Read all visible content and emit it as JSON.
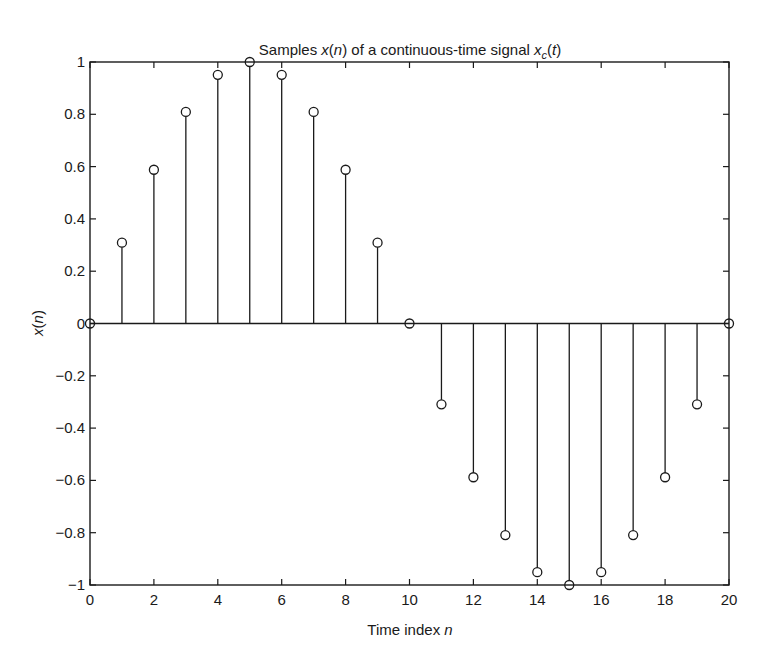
{
  "chart_data": {
    "type": "stem",
    "title_parts": {
      "prefix": "Samples ",
      "x": "x",
      "n": "n",
      "middle": " of a continuous-time signal ",
      "xc": "x",
      "sub": "c",
      "t": "t"
    },
    "xlabel": "Time index n",
    "xlabel_parts": {
      "text": "Time index ",
      "var": "n"
    },
    "ylabel": "x(n)",
    "ylabel_parts": {
      "x": "x",
      "n": "n"
    },
    "xlim": [
      0,
      20
    ],
    "ylim": [
      -1,
      1
    ],
    "grid": false,
    "legend": null,
    "marker": "open-circle",
    "color": "#1a1a1a",
    "xticks": [
      0,
      2,
      4,
      6,
      8,
      10,
      12,
      14,
      16,
      18,
      20
    ],
    "xtick_labels": [
      "0",
      "2",
      "4",
      "6",
      "8",
      "10",
      "12",
      "14",
      "16",
      "18",
      "20"
    ],
    "yticks": [
      1,
      0.8,
      0.6,
      0.4,
      0.2,
      0,
      -0.2,
      -0.4,
      -0.6,
      -0.8,
      -1
    ],
    "ytick_labels": [
      "1",
      "0.8",
      "0.6",
      "0.4",
      "0.2",
      "0",
      "−0.2",
      "−0.4",
      "−0.6",
      "−0.8",
      "−1"
    ],
    "x": [
      0,
      1,
      2,
      3,
      4,
      5,
      6,
      7,
      8,
      9,
      10,
      11,
      12,
      13,
      14,
      15,
      16,
      17,
      18,
      19,
      20
    ],
    "values": [
      0,
      0.309,
      0.588,
      0.809,
      0.951,
      1.0,
      0.951,
      0.809,
      0.588,
      0.309,
      0,
      -0.309,
      -0.588,
      -0.809,
      -0.951,
      -1.0,
      -0.951,
      -0.809,
      -0.588,
      -0.309,
      0
    ]
  }
}
